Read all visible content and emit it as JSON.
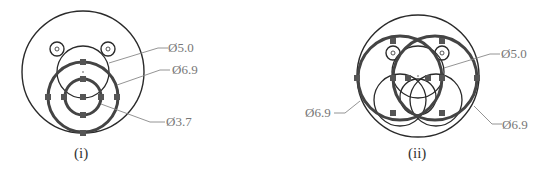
{
  "figure_i": {
    "caption": "(i)",
    "labels": {
      "d1": "Ø5.0",
      "d2": "Ø6.9",
      "d3": "Ø3.7"
    }
  },
  "figure_ii": {
    "caption": "(ii)",
    "labels": {
      "d1": "Ø5.0",
      "d2_left": "Ø6.9",
      "d2_right": "Ø6.9"
    }
  },
  "colors": {
    "stroke": "#2a2a2a",
    "thick_stroke": "#3a3a3a",
    "handle": "#555555",
    "leader": "#888888",
    "label": "#777777"
  }
}
